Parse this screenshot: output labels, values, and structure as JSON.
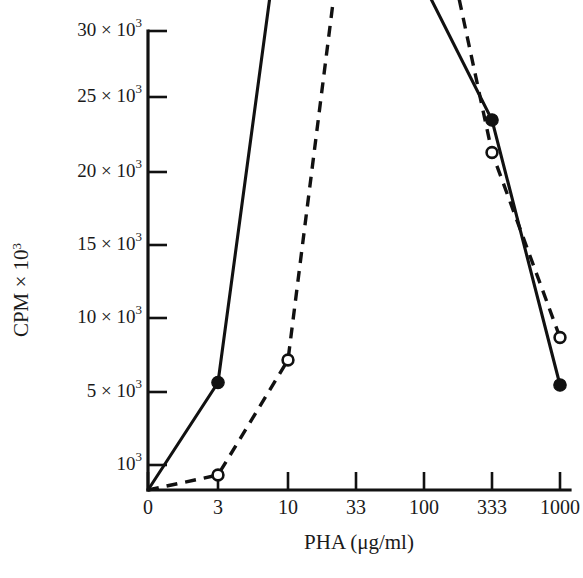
{
  "chart_data": {
    "type": "line",
    "title": "",
    "subtitle": "",
    "xlabel": "PHA (μg/ml)",
    "ylabel": "CPM × 10³",
    "xlabel_parts": {
      "name": "PHA",
      "units": "(μg/ml)"
    },
    "ylabel_parts": {
      "name": "CPM",
      "times": "×",
      "mantissa": "10",
      "exponent": "3"
    },
    "x_scale": "categorical-log",
    "categories": [
      "0",
      "3",
      "10",
      "33",
      "100",
      "333",
      "1000"
    ],
    "x_tick_labels": [
      "0",
      "3",
      "10",
      "33",
      "100",
      "333",
      "1000"
    ],
    "y_tick_labels": [
      "10³",
      "5 × 10³",
      "10 × 10³",
      "15 × 10³",
      "20 × 10³",
      "25 × 10³",
      "30 × 10³"
    ],
    "y_tick_values": [
      1000,
      5000,
      10000,
      15000,
      20000,
      25000,
      30000
    ],
    "y_tick_parts": [
      {
        "coef": "",
        "times": "",
        "mantissa": "10",
        "exponent": "3"
      },
      {
        "coef": "5",
        "times": "×",
        "mantissa": "10",
        "exponent": "3"
      },
      {
        "coef": "10",
        "times": "×",
        "mantissa": "10",
        "exponent": "3"
      },
      {
        "coef": "15",
        "times": "×",
        "mantissa": "10",
        "exponent": "3"
      },
      {
        "coef": "20",
        "times": "×",
        "mantissa": "10",
        "exponent": "3"
      },
      {
        "coef": "25",
        "times": "×",
        "mantissa": "10",
        "exponent": "3"
      },
      {
        "coef": "30",
        "times": "×",
        "mantissa": "10",
        "exponent": "3"
      }
    ],
    "ylim": [
      0,
      31700
    ],
    "grid": false,
    "legend": "none",
    "series": [
      {
        "name": "solid-filled-circles",
        "marker": "filled-circle",
        "line_style": "solid",
        "color": "#111111",
        "x": [
          "0",
          "3",
          "10",
          "33",
          "100",
          "333",
          "1000"
        ],
        "values": [
          0,
          4300,
          25100,
          30000,
          20200,
          14800,
          4200
        ]
      },
      {
        "name": "dashed-open-circles",
        "marker": "open-circle",
        "line_style": "dashed",
        "color": "#111111",
        "x": [
          "0",
          "3",
          "10",
          "33",
          "100",
          "333",
          "1000"
        ],
        "values": [
          0,
          600,
          5200,
          26800,
          26200,
          13500,
          6100
        ]
      }
    ]
  },
  "figure": {
    "background": "#ffffff",
    "ink_color": "#111111"
  }
}
